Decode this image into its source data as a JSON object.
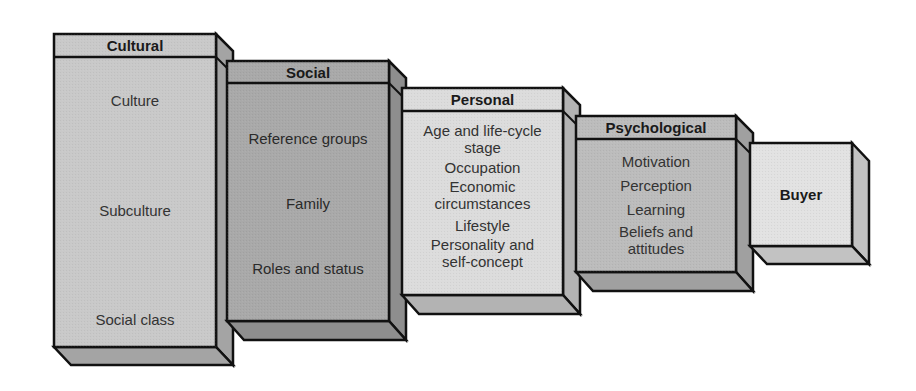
{
  "diagram": {
    "type": "staircase-blocks",
    "colors": {
      "cultural_face": "#c9c9c9",
      "social_face": "#a9a9a9",
      "personal_face": "#dcdcdc",
      "psychological_face": "#bcbcbc",
      "buyer_face": "#e2e2e2",
      "side_shade": "#9a9a9a",
      "outline": "#111111"
    },
    "blocks": [
      {
        "id": "cultural",
        "title": "Cultural",
        "items": [
          "Culture",
          "Subculture",
          "Social class"
        ]
      },
      {
        "id": "social",
        "title": "Social",
        "items": [
          "Reference groups",
          "Family",
          "Roles and status"
        ]
      },
      {
        "id": "personal",
        "title": "Personal",
        "items": [
          "Age and life-cycle stage",
          "Occupation",
          "Economic circumstances",
          "Lifestyle",
          "Personality and self-concept"
        ]
      },
      {
        "id": "psychological",
        "title": "Psychological",
        "items": [
          "Motivation",
          "Perception",
          "Learning",
          "Beliefs and attitudes"
        ]
      },
      {
        "id": "buyer",
        "title": "Buyer",
        "items": []
      }
    ]
  }
}
